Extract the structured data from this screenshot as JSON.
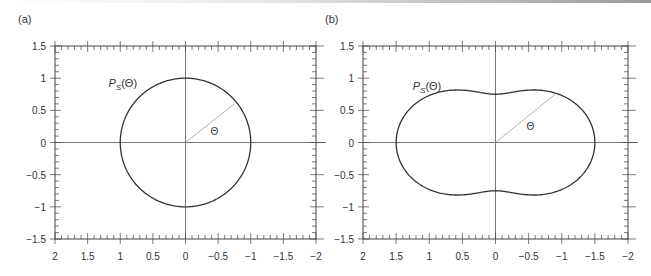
{
  "chart_data": [
    {
      "type": "line",
      "panel_label": "(a)",
      "title": "",
      "curve_label": "P_S(Θ)",
      "curve_label_main": "P",
      "curve_label_sub": "S",
      "curve_label_arg": "(Θ)",
      "angle_label": "Θ",
      "xlabel": "",
      "ylabel": "",
      "xlim": [
        2,
        -2
      ],
      "ylim": [
        -1.5,
        1.5
      ],
      "x_ticks": [
        "2",
        "1.5",
        "1",
        "0.5",
        "0",
        "−0.5",
        "−1",
        "−1.5",
        "−2"
      ],
      "y_ticks": [
        "1.5",
        "1",
        "0.5",
        "0",
        "−0.5",
        "−1",
        "−1.5"
      ],
      "description": "Polar plot of scattering phase function, isotropic: circle of radius 1",
      "series": [
        {
          "name": "P_S(Θ)",
          "r": "1",
          "points": [
            [
              1,
              0
            ],
            [
              0.707,
              0.707
            ],
            [
              0,
              1
            ],
            [
              -0.707,
              0.707
            ],
            [
              -1,
              0
            ],
            [
              -0.707,
              -0.707
            ],
            [
              0,
              -1
            ],
            [
              0.707,
              -0.707
            ]
          ]
        }
      ],
      "angle_line_endpoint": [
        -0.75,
        0.6
      ],
      "grid": false
    },
    {
      "type": "line",
      "panel_label": "(b)",
      "title": "",
      "curve_label": "P_S(Θ)",
      "curve_label_main": "P",
      "curve_label_sub": "S",
      "curve_label_arg": "(Θ)",
      "angle_label": "Θ",
      "xlabel": "",
      "ylabel": "",
      "xlim": [
        2,
        -2
      ],
      "ylim": [
        -1.5,
        1.5
      ],
      "x_ticks": [
        "2",
        "1.5",
        "1",
        "0.5",
        "0",
        "−0.5",
        "−1",
        "−1.5",
        "−2"
      ],
      "y_ticks": [
        "1.5",
        "1",
        "0.5",
        "0",
        "−0.5",
        "−1",
        "−1.5"
      ],
      "description": "Rayleigh phase function 0.75(1+cos²Θ) in polar form: peanut shape, r=1.5 at Θ=0,180°, r=0.75 at 90°",
      "series": [
        {
          "name": "P_S(Θ)",
          "r": "0.75*(1+cos^2(Θ))",
          "points": [
            [
              1.5,
              0
            ],
            [
              0.6,
              0.8
            ],
            [
              0,
              0.75
            ],
            [
              -0.6,
              0.8
            ],
            [
              -1.5,
              0
            ],
            [
              -0.6,
              -0.8
            ],
            [
              0,
              -0.75
            ],
            [
              0.6,
              -0.8
            ]
          ]
        }
      ],
      "angle_line_endpoint": [
        -0.9,
        0.75
      ],
      "grid": false
    }
  ]
}
